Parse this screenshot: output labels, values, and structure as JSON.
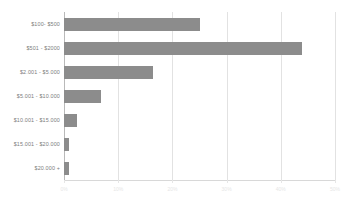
{
  "chart_data": {
    "type": "bar",
    "orientation": "horizontal",
    "title": "",
    "xlabel": "",
    "ylabel": "",
    "categories": [
      "$100- $500",
      "$501 - $2000",
      "$2.001 - $5.000",
      "$5.001 - $10.000",
      "$10.001 - $15.000",
      "$15.001 - $20.000",
      "$20.000 +"
    ],
    "values": [
      25,
      44,
      16.4,
      6.8,
      2.4,
      1,
      1
    ],
    "value_unit": "%",
    "xlim": [
      0,
      50
    ],
    "xticks": [
      0,
      10,
      20,
      30,
      40,
      50
    ],
    "xtick_labels": [
      "0%",
      "10%",
      "20%",
      "30%",
      "40%",
      "50%"
    ],
    "grid": true,
    "legend": false,
    "bar_color": "#8c8c8c",
    "gridline_color": "#e2e2e2",
    "label_color": "#7d7d7d",
    "background": "#ffffff"
  }
}
